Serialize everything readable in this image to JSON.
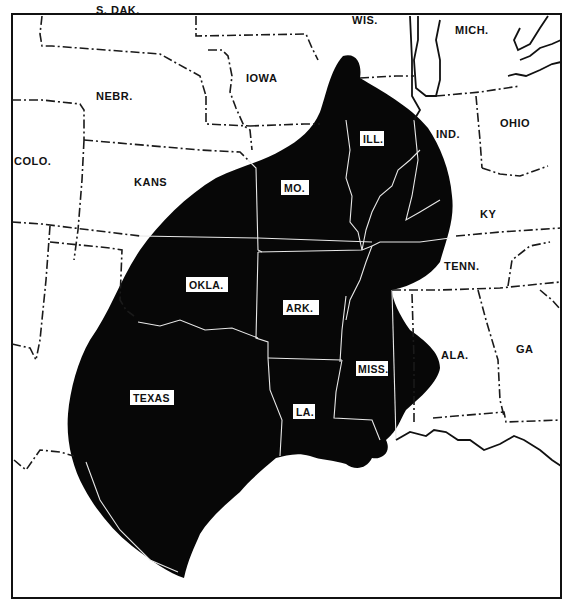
{
  "map": {
    "title": "",
    "description": "Black-shaded range across the south-central United States",
    "colors": {
      "range_fill": "#070707",
      "background": "#ffffff",
      "borders": "#1a1a1a"
    },
    "states_outside_range": {
      "sdak": "S. DAK.",
      "wis": "WIS.",
      "mich": "MICH.",
      "nebr": "NEBR.",
      "iowa": "IOWA",
      "colo": "COLO.",
      "kans": "KANS",
      "ind": "IND.",
      "ohio": "OHIO",
      "ky": "KY",
      "tenn": "TENN.",
      "ala": "ALA.",
      "ga": "GA"
    },
    "states_in_range": {
      "ill": "ILL.",
      "mo": "MO.",
      "okla": "OKLA.",
      "ark": "ARK.",
      "miss": "MISS.",
      "texas": "TEXAS",
      "la": "LA."
    }
  }
}
